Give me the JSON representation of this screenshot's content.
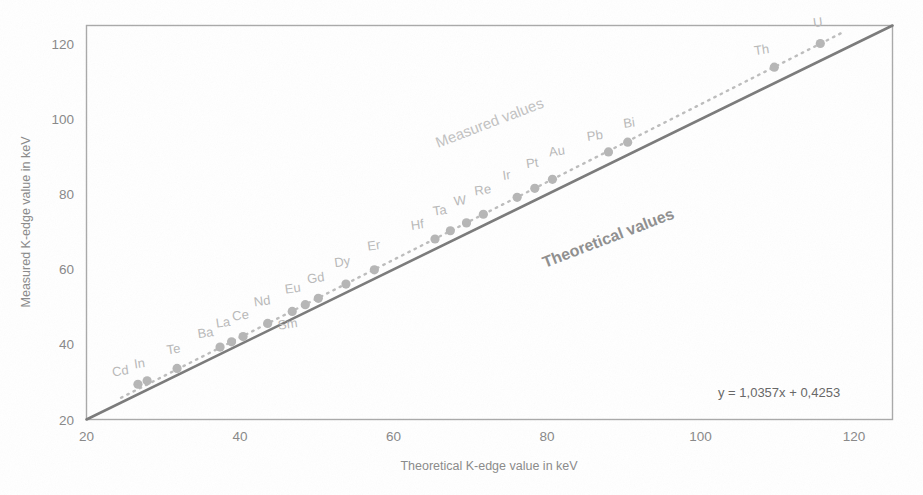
{
  "axes": {
    "x_title": "Theoretical K-edge value in keV",
    "y_title": "Measured K-edge value in keV",
    "x_ticks": [
      "20",
      "40",
      "60",
      "80",
      "100",
      "120"
    ],
    "y_ticks": [
      "20",
      "40",
      "60",
      "80",
      "100",
      "120"
    ]
  },
  "annotations": {
    "measured": "Measured values",
    "theoretical": "Theoretical values",
    "equation": "y = 1,0357x + 0,4253"
  },
  "colors": {
    "marker": "#b6b6b6",
    "theory_line": "#7a7a7a",
    "fit_line": "#bdbdbd",
    "frame": "#a9a9a9",
    "label_text": "#b9b9b9",
    "tick_text": "#888888"
  },
  "chart_data": {
    "type": "scatter",
    "title": "",
    "xlabel": "Theoretical K-edge value in keV",
    "ylabel": "Measured K-edge value in keV",
    "xlim": [
      20,
      125
    ],
    "ylim": [
      20,
      125
    ],
    "xticks": [
      20,
      40,
      60,
      80,
      100,
      120
    ],
    "yticks": [
      20,
      40,
      60,
      80,
      100,
      120
    ],
    "grid": false,
    "legend": "annotated inline",
    "series": [
      {
        "name": "Measured values",
        "marker": "circle",
        "color": "#b6b6b6",
        "points": [
          {
            "label": "Cd",
            "x": 26.7,
            "y": 29.4
          },
          {
            "label": "In",
            "x": 27.9,
            "y": 30.3
          },
          {
            "label": "Te",
            "x": 31.8,
            "y": 33.6
          },
          {
            "label": "Ba",
            "x": 37.4,
            "y": 39.3
          },
          {
            "label": "La",
            "x": 38.9,
            "y": 40.7
          },
          {
            "label": "Ce",
            "x": 40.4,
            "y": 42.1
          },
          {
            "label": "Nd",
            "x": 43.6,
            "y": 45.6
          },
          {
            "label": "Sm",
            "x": 46.8,
            "y": 48.8
          },
          {
            "label": "Eu",
            "x": 48.5,
            "y": 50.6
          },
          {
            "label": "Gd",
            "x": 50.2,
            "y": 52.3
          },
          {
            "label": "Dy",
            "x": 53.8,
            "y": 56.1
          },
          {
            "label": "Er",
            "x": 57.5,
            "y": 59.9
          },
          {
            "label": "Hf",
            "x": 65.4,
            "y": 68.1
          },
          {
            "label": "Ta",
            "x": 67.4,
            "y": 70.3
          },
          {
            "label": "W",
            "x": 69.5,
            "y": 72.4
          },
          {
            "label": "Re",
            "x": 71.7,
            "y": 74.7
          },
          {
            "label": "Ir",
            "x": 76.1,
            "y": 79.2
          },
          {
            "label": "Pt",
            "x": 78.4,
            "y": 81.6
          },
          {
            "label": "Au",
            "x": 80.7,
            "y": 84.0
          },
          {
            "label": "Pb",
            "x": 88.0,
            "y": 91.3
          },
          {
            "label": "Bi",
            "x": 90.5,
            "y": 93.9
          },
          {
            "label": "Th",
            "x": 109.6,
            "y": 113.9
          },
          {
            "label": "U",
            "x": 115.6,
            "y": 120.2
          }
        ]
      }
    ],
    "lines": [
      {
        "name": "Theoretical values",
        "type": "identity",
        "equation": "y = x",
        "from": [
          20,
          20
        ],
        "to": [
          125,
          125
        ],
        "style": "solid",
        "color": "#7a7a7a"
      },
      {
        "name": "Linear fit of measured values",
        "type": "regression",
        "equation": "y = 1,0357x + 0,4253",
        "slope": 1.0357,
        "intercept": 0.4253,
        "style": "dotted",
        "color": "#bdbdbd"
      }
    ]
  }
}
